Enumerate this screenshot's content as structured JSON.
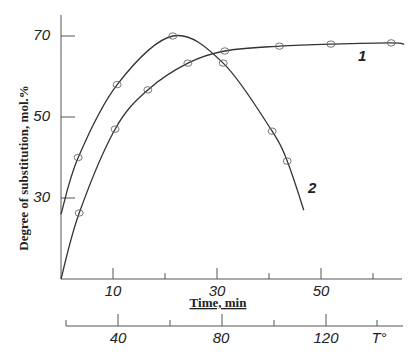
{
  "chart_data": {
    "type": "line",
    "title": "",
    "xlabel": "Time, min",
    "ylabel": "Degree of substitution, mol.%",
    "xlim": [
      0,
      67
    ],
    "ylim": [
      10,
      76
    ],
    "xticks": [
      10,
      30,
      50
    ],
    "xticks_minor": [
      20,
      40,
      60
    ],
    "yticks": [
      30,
      50,
      70
    ],
    "secondary_xaxis": {
      "label": "T°",
      "ticks": [
        40,
        80,
        120
      ],
      "tick_labels": [
        "40",
        "80",
        "120"
      ],
      "note": "temperature scale below time axis"
    },
    "grid": false,
    "legend": "inline curve labels",
    "series": [
      {
        "name": "1",
        "points": [
          [
            3.5,
            26.3
          ],
          [
            10.4,
            47
          ],
          [
            16.7,
            56.7
          ],
          [
            24.4,
            63.3
          ],
          [
            31.5,
            66.3
          ],
          [
            42,
            67.5
          ],
          [
            51.9,
            68
          ],
          [
            63.5,
            68.3
          ]
        ],
        "curve": [
          [
            0,
            10
          ],
          [
            3.5,
            26.3
          ],
          [
            10.4,
            47
          ],
          [
            16.7,
            56.7
          ],
          [
            24.4,
            63.3
          ],
          [
            31.5,
            66.3
          ],
          [
            42,
            67.5
          ],
          [
            51.9,
            68
          ],
          [
            63.5,
            68.3
          ],
          [
            66,
            68
          ]
        ]
      },
      {
        "name": "2",
        "points": [
          [
            3.3,
            40
          ],
          [
            10.8,
            58
          ],
          [
            21.5,
            70
          ],
          [
            31.2,
            63.3
          ],
          [
            40.6,
            46.5
          ],
          [
            43.5,
            39.1
          ]
        ],
        "curve": [
          [
            0,
            26
          ],
          [
            3.3,
            40
          ],
          [
            10.8,
            58
          ],
          [
            21.5,
            70
          ],
          [
            31.2,
            63.3
          ],
          [
            40.6,
            46.5
          ],
          [
            43.5,
            39.1
          ],
          [
            46.7,
            27
          ]
        ]
      }
    ]
  },
  "labels": {
    "ylabel": "Degree of substitution, mol.%",
    "xlabel": "Time, min",
    "xticks": [
      "10",
      "30",
      "50"
    ],
    "yticks": [
      "70",
      "50",
      "30"
    ],
    "t_ticks": [
      "40",
      "80",
      "120"
    ],
    "t_unit": "T°",
    "curve1": "1",
    "curve2": "2"
  }
}
